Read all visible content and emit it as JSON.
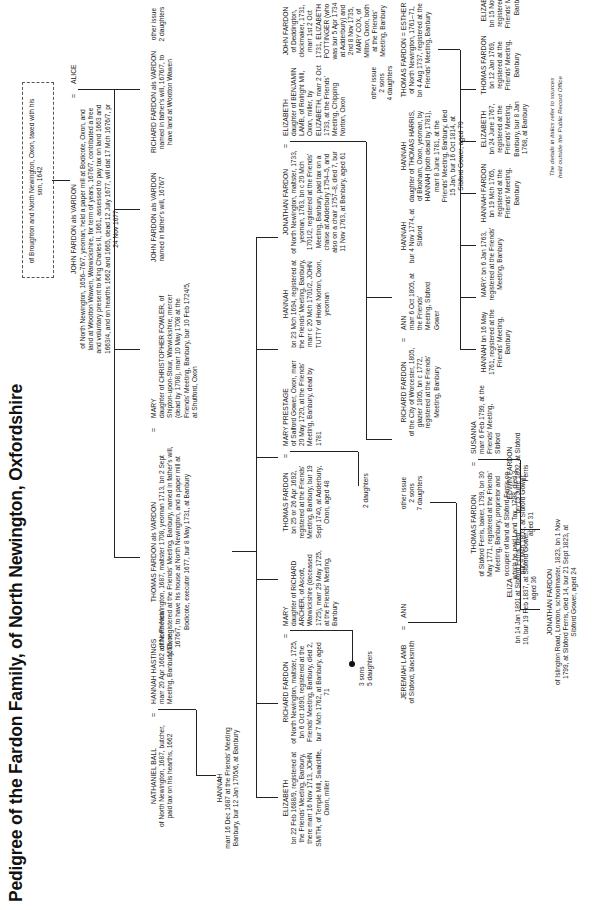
{
  "title": "Pedigree of the Fardon Family, of North Newington, Oxfordshire",
  "footnote_line1": "The details in italics refer to sources",
  "footnote_line2": "held outside the Public Record Office",
  "generations": {
    "g1": {
      "john_fardon_vardon": {
        "name": "JOHN FARDON als VARDON",
        "body": "of North Newington, 1656–76/7, yeoman, held a paper mill at Bodicote, Oxon, and land at Wootton Wawen, Warwickshire, for term of years, 1676/7, contributed a free and voluntary present to King Charles II, 1661, assessed to pay tax on land 1663 and 1663/4, and on hearths 1662 and 1665, dead 12 July 1677, will dat 17 Mch 1676/7, pr 24 Nov 1677"
      },
      "alice": {
        "name": "ALICE"
      },
      "top_note": "of Broughton and North Newington, Oxon, taxed with his son, 1642"
    },
    "g2": {
      "nathaniel_ball": {
        "name": "NATHANIEL BALL",
        "body": "of North Newington, 1687, butcher, paid tax on his hearths, 1662"
      },
      "hannah_hastings": {
        "name": "HANNAH HASTINGS",
        "body": "marr 20 Apr 1662 at the Friends' Meeting, Banbury, Oxon"
      },
      "thomas_fardon_vardon": {
        "name": "THOMAS FARDON als VARDON",
        "body": "of North Newington, 1687, maltster 1708, yeoman 1713, bn 2 Sept 1656, registered at the Friends' Meeting, Banbury, named in father's will, 1676/7, to have his house at North Newington, and a paper mill at Bodicote, executor 1677, bur 8 May 1731, at Banbury"
      },
      "john_fardon_vardon2": {
        "name": "JOHN FARDON als VARDON",
        "body": "named in father's will, 1676/7"
      },
      "richard_fardon_vardon": {
        "name": "RICHARD FARDON als VARDON",
        "body": "named in father's will, 1676/7, to have land at Wootton Wawen"
      },
      "mary_fowler": {
        "name": "MARY",
        "body": "daughter of CHRISTOPHER FOWLER, of Shipton-upon-Stour, Warwickshire, mercer (dead by 1708), marr 10 May 1708 at the Friends' Meeting, Banbury, bur 10 Feb 1724/5, at Shutford, Oxon"
      },
      "other_issue_2daughters": "other issue\n2 daughters"
    },
    "g3": {
      "hannah": {
        "name": "HANNAH",
        "body": "marr 16 Dec 1687 at the Friends' Meeting Banbury, bur 12 Jan 1705/6, at Banbury"
      },
      "elizabeth_smith": {
        "name": "ELIZABETH",
        "body": "bn 22 Feb 1688/9, registered at the Friends' Meeting, Banbury, there marr 16 Nov 1713, JOHN SMITH, of Temple Mill, Swalcliffe, Oxon, miller"
      },
      "richard_fardon": {
        "name": "RICHARD FARDON",
        "body": "of North Newington, maltster, 1725, bn 6 Oct 1690, registered at the Friends' Meeting, Banbury, died 2, bur 7 Mch 1762, at Banbury, aged 71"
      },
      "mary_archer": {
        "name": "MARY",
        "body": "daughter of RICHARD ARCHER, of Ascott, Warwickshire (deceased 1725), marr 29 May 1725, at the Friends' Meeting, Banbury"
      },
      "thomas_fardon": {
        "name": "THOMAS FARDON",
        "body": "bn 25 or 26 Apr 1692, registered at the Friends' Meeting, Banbury, bur 19 Sept 1740, at Adderbury, Oxon, aged 48"
      },
      "mary_prestage": {
        "name": "MARY PRESTAGE",
        "body": "of Salford Gower, Oxon, marr 20 May 1720, at the Friends' Meeting, Banbury, dead by 1781"
      },
      "hannah_fardon_1694": {
        "name": "HANNAH",
        "body": "bn 23 Mch 1694, registered at the Friends' Meeting, Banbury, marr c 20 Mch 1701/2, JOHN TUTTY of Hook Norton, Oxon, yeoman"
      },
      "jonathan_fardon": {
        "name": "JONATHAN FARDON",
        "body": "of North Newington, maltster, 1733, yeoman, 1763, bn c 20 Mch 1701/2, registered at the Friends' Meeting, Banbury, paid tax on a chaise at Adderbury 1754–5, and also on a chair 1757–8, died 7, bur 11 Nov 1763, at Banbury, aged 61"
      },
      "elizabeth_lamb": {
        "name": "ELIZABETH",
        "body": "daughter of BENJAMIN LAMB, of Rolright Mill, Oxon, miller, by ELIZABETH, marr 2 Oct 1733, at the Friends' Meeting, Chipping Norton, Oxon"
      },
      "john_fardon_deddington": {
        "name": "JOHN FARDON",
        "body": "of Deddington, clockmaker, 1731, marr 1st 2 Oct 1731, ELIZABETH POTTINGER (who was bur 5 Apr 1734 at Adderbury) and 2nd 8 Nov 1735, MARY COX, of Milton, Oxon, both at the Friends' Meeting, Banbury"
      },
      "other_issue_2sons": "other issue\n2 sons\n4 daughters"
    },
    "g4": {
      "jeremiah_lamb": {
        "name": "JEREMIAH LAMB",
        "body": "of Sibford, blacksmith"
      },
      "ann_lamb": {
        "name": "ANN"
      },
      "thomas_fardon_susanna": {
        "name": "THOMAS FARDON",
        "body": "of Sibford Ferris, baker, 1799, bn 30 May 1771, registered at the Friends' Meeting, Banbury, proprietor and occupier of land at Sibford Ferris on which he paid Land Tax, 1798, died 3, bur 9 Mch 1803, at Sibford Gower, aged 31"
      },
      "susanna": {
        "name": "SUSANNA",
        "body": "marr 6 Feb 1799, at the Friends' Meeting, Sibford"
      },
      "richard_fardon_islington": {
        "name": "RICHARD FARDON",
        "body": "of the City of Worcester, 1805, glazier 1805, bn c 1772, registered at the Friends' Meeting, Banbury"
      },
      "ann_worcester": {
        "name": "ANN",
        "body": "marr 6 Oct 1805, at the Friends' Meeting, Sibford Gower"
      },
      "hannah_1774": {
        "name": "HANNAH",
        "body": "bur 4 Nov 1774, at Sibford"
      },
      "hannah_harris": {
        "name": "HANNAH",
        "body": "daughter of THOMAS HARRIS, of Bloxham, Oxon, yeoman, by HANNAH (both dead by 1781), marr 8 June 1781, at the Friends' Meeting, Banbury, died 15 Jan, bur 16 Oct 1814, at Sibford Gower, aged 70"
      },
      "thomas_fardon_esther": {
        "name": "THOMAS FARDON",
        "spouse": "ESTHER",
        "body": "of North Newington, 1761–71, bn 4 Aug 1737, registered at the Friends' Meeting, Banbury"
      },
      "hannah_1761": {
        "body": "HANNAH bn 16 May 1761, registered at the Friends' Meeting, Banbury"
      },
      "mary_1763": {
        "body": "MARY: bn 6 Jan 1763, registered at the Friends' Meeting, Banbury"
      },
      "hannah_fardon_1765": {
        "name": "HANNAH FARDON",
        "body": "bn 19 Mch 1765, registered at the Friends' Meeting, Banbury"
      },
      "elizabeth_1767": {
        "name": "ELIZABETH",
        "body": "bn 24 June 1767, registered at the Friends' Meeting, Banbury, bur 8 Jan 1768, at Banbury"
      },
      "thomas_fardon_1769": {
        "name": "THOMAS FARDON",
        "body": "bn 12 Jan 1769, registered at the Friends' Meeting, Banbury"
      },
      "elizabeth_1771": {
        "name": "ELIZABETH",
        "body": "bn 15 Nov 1771, registered at the Friends' Meeting, Banbury"
      },
      "two_daughters": "2 daughters",
      "other_issue_2sons7d": "other issue\n2 sons\n7 daughters",
      "three_sons_five_daughters": "3 sons\n5 daughters"
    },
    "g5": {
      "eliza": {
        "name": "ELIZA",
        "body": "bn 14 Jan 1801 at Sibford Ferris, died 10, bur 19 Feb 1837, at Sibford Gower, aged 36"
      },
      "edwin_fardon": {
        "name": "EDWIN FARDON",
        "body": "bn 15 June 1802, at Sibford Ferris"
      },
      "jonathan_fardon_islington": {
        "name": "JONATHAN FARDON",
        "body": "of Islington Road, London, schoolmaster, 1823, bn 1 Nov 1799, at Sibford Ferris, died 14, bur 21 Sept 1823, at Sibford Gower, aged 24"
      }
    }
  }
}
